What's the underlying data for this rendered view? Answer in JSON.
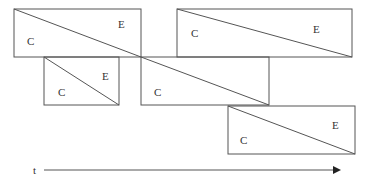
{
  "labels": {
    "c": "C",
    "e": "E",
    "t": "t"
  },
  "boxes": [
    {
      "x": 14,
      "y": 9,
      "w": 127,
      "h": 48
    },
    {
      "x": 177,
      "y": 9,
      "w": 175,
      "h": 48
    },
    {
      "x": 44,
      "y": 57,
      "w": 75,
      "h": 48
    },
    {
      "x": 141,
      "y": 57,
      "w": 128,
      "h": 48
    },
    {
      "x": 228,
      "y": 106,
      "w": 127,
      "h": 48
    }
  ]
}
